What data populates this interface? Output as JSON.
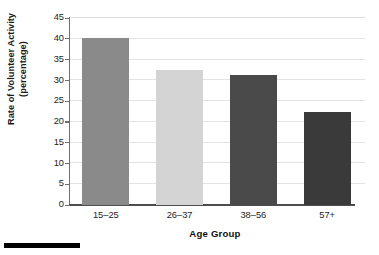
{
  "chart_data": {
    "type": "bar",
    "title": "",
    "subtitle": "",
    "xlabel": "Age Group",
    "ylabel": "Rate of Volunteer Activity (percentage)",
    "ylabel_lines": [
      "Rate of Volunteer Activity",
      "(percentage)"
    ],
    "categories": [
      "15–25",
      "26–37",
      "38–56",
      "57+"
    ],
    "values": [
      40.2,
      32.5,
      31.2,
      22.3
    ],
    "series": [
      {
        "name": "Rate of Volunteer Activity",
        "values": [
          40.2,
          32.5,
          31.2,
          22.3
        ]
      }
    ],
    "ylim": [
      0,
      45
    ],
    "xlim": [
      0,
      4
    ],
    "y_ticks": [
      0,
      5,
      10,
      15,
      20,
      25,
      30,
      35,
      40,
      45
    ],
    "y_tick_labels": [
      "0",
      "5",
      "10",
      "15",
      "20",
      "25",
      "30",
      "35",
      "40",
      "45"
    ],
    "y_tick_interval": 5,
    "grid": true,
    "grid_axis": "y",
    "legend": false,
    "legend_position": "none",
    "bar_colors": [
      "#8a8a8a",
      "#d4d4d4",
      "#4a4a4a",
      "#3a3a3a"
    ],
    "annotations": [],
    "data_labels": false,
    "colors": {
      "background": "#ffffff",
      "gridline": "#e3e3e3",
      "axis_line": "#4d4d4d",
      "text": "#1a1a1a",
      "artifact": "#000000"
    }
  }
}
